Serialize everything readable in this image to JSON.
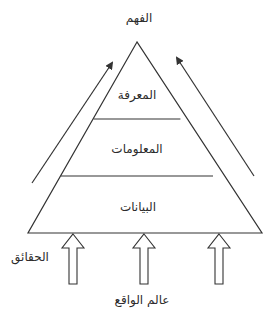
{
  "diagram": {
    "colors": {
      "stroke": "#333333",
      "text": "#2b2b2b",
      "background": "#ffffff"
    },
    "apex_label": "الفهم",
    "levels": [
      {
        "id": "knowledge",
        "label": "المعرفة"
      },
      {
        "id": "information",
        "label": "المعلومات"
      },
      {
        "id": "data",
        "label": "البيانات"
      }
    ],
    "input_label": "الحقائق",
    "source_label": "عالم الواقع",
    "arrows": {
      "left_diagonal": "arrow-up-right",
      "right_diagonal": "arrow-up-left",
      "inputs": [
        "hollow-arrow-up",
        "hollow-arrow-up",
        "hollow-arrow-up"
      ]
    }
  }
}
